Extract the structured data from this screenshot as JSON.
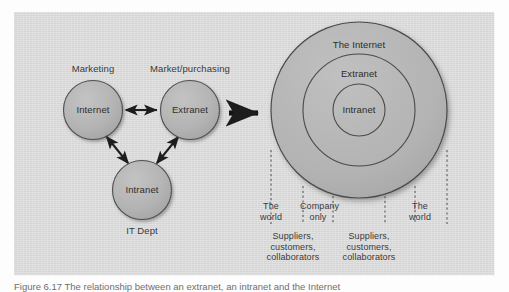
{
  "figure": {
    "panel_background": "#d9d9d9",
    "node_fill": "#b2b2b2",
    "node_stroke": "#555555",
    "text_color": "#3a3a3a",
    "caption": "Figure 6.17 The relationship between an extranet, an intranet and the Internet"
  },
  "left_diagram": {
    "nodes": [
      {
        "id": "internet",
        "label": "Internet",
        "owner": "Marketing",
        "owner_position": "above"
      },
      {
        "id": "extranet",
        "label": "Extranet",
        "owner": "Market/purchasing",
        "owner_position": "above"
      },
      {
        "id": "intranet",
        "label": "Intranet",
        "owner": "IT Dept",
        "owner_position": "below"
      }
    ],
    "connections": [
      {
        "from": "internet",
        "to": "extranet",
        "type": "double-arrow"
      },
      {
        "from": "internet",
        "to": "intranet",
        "type": "double-arrow"
      },
      {
        "from": "extranet",
        "to": "intranet",
        "type": "double-arrow"
      }
    ]
  },
  "transition_arrow": {
    "label": "",
    "direction": "right"
  },
  "right_diagram": {
    "rings": [
      {
        "id": "outer",
        "label": "The Internet"
      },
      {
        "id": "middle",
        "label": "Extranet"
      },
      {
        "id": "inner",
        "label": "Intranet"
      }
    ],
    "zones": [
      {
        "id": "zone-left-world",
        "line1": "The",
        "line2": "world"
      },
      {
        "id": "zone-company",
        "line1": "Company",
        "line2": "only"
      },
      {
        "id": "zone-right-world",
        "line1": "The",
        "line2": "world"
      }
    ],
    "actors": [
      {
        "id": "actors-left",
        "line1": "Suppliers,",
        "line2": "customers,",
        "line3": "collaborators"
      },
      {
        "id": "actors-right",
        "line1": "Suppliers,",
        "line2": "customers,",
        "line3": "collaborators"
      }
    ]
  }
}
